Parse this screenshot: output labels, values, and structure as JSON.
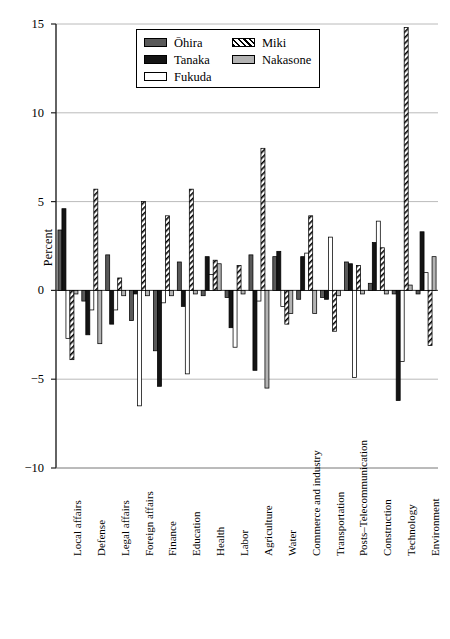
{
  "chart_data": {
    "type": "bar",
    "title": "",
    "xlabel": "",
    "ylabel": "Percent",
    "ylim": [
      -10,
      15
    ],
    "yticks": [
      -10,
      -5,
      0,
      5,
      10,
      15
    ],
    "ytick_labels": [
      "−10",
      "−5",
      "0",
      "5",
      "10",
      "15"
    ],
    "grid": true,
    "grid_axis": "y",
    "legend_position": "upper center",
    "categories": [
      "Local affairs",
      "Defense",
      "Legal affairs",
      "Foreign affairs",
      "Finance",
      "Education",
      "Health",
      "Labor",
      "Agriculture",
      "Water",
      "Commerce and industry",
      "Transportation",
      "Posts–Telecommunication",
      "Construction",
      "Technology",
      "Environment"
    ],
    "series": [
      {
        "name": "Ōhira",
        "fill": "dark-gray",
        "color": "#595959",
        "values": [
          3.4,
          -0.6,
          2.0,
          -1.7,
          -3.4,
          1.6,
          -0.3,
          -0.4,
          2.0,
          1.9,
          -0.5,
          -0.4,
          1.6,
          0.4,
          -0.2,
          -0.2
        ]
      },
      {
        "name": "Tanaka",
        "fill": "black",
        "color": "#141414",
        "values": [
          4.6,
          -2.5,
          -1.9,
          -0.2,
          -5.4,
          -0.9,
          1.9,
          -2.1,
          -4.5,
          2.2,
          1.9,
          -0.5,
          1.5,
          2.7,
          -6.2,
          3.3
        ]
      },
      {
        "name": "Fukuda",
        "fill": "white",
        "color": "#ffffff",
        "values": [
          -2.7,
          -1.1,
          -1.1,
          -6.5,
          -0.7,
          -4.7,
          0.9,
          -3.2,
          -0.6,
          -0.9,
          2.1,
          3.0,
          -4.9,
          3.9,
          -4.0,
          1.0
        ]
      },
      {
        "name": "Miki",
        "fill": "hatched",
        "color": "#ffffff",
        "values": [
          -3.9,
          5.7,
          0.7,
          5.0,
          4.2,
          5.7,
          1.7,
          1.4,
          8.0,
          -1.9,
          4.2,
          -2.3,
          1.4,
          2.4,
          14.8,
          -3.1
        ]
      },
      {
        "name": "Nakasone",
        "fill": "light-gray",
        "color": "#b3b3b3",
        "values": [
          -0.2,
          -3.0,
          -0.3,
          -0.3,
          -0.3,
          -0.2,
          1.5,
          -0.2,
          -5.5,
          -1.3,
          -1.3,
          -0.3,
          -0.2,
          -0.2,
          0.3,
          1.9
        ]
      }
    ]
  },
  "legend": {
    "entries": [
      {
        "label": "Ōhira",
        "fill": "dark-gray"
      },
      {
        "label": "Tanaka",
        "fill": "black"
      },
      {
        "label": "Fukuda",
        "fill": "white"
      },
      {
        "label": "Miki",
        "fill": "hatched"
      },
      {
        "label": "Nakasone",
        "fill": "light-gray"
      }
    ]
  }
}
